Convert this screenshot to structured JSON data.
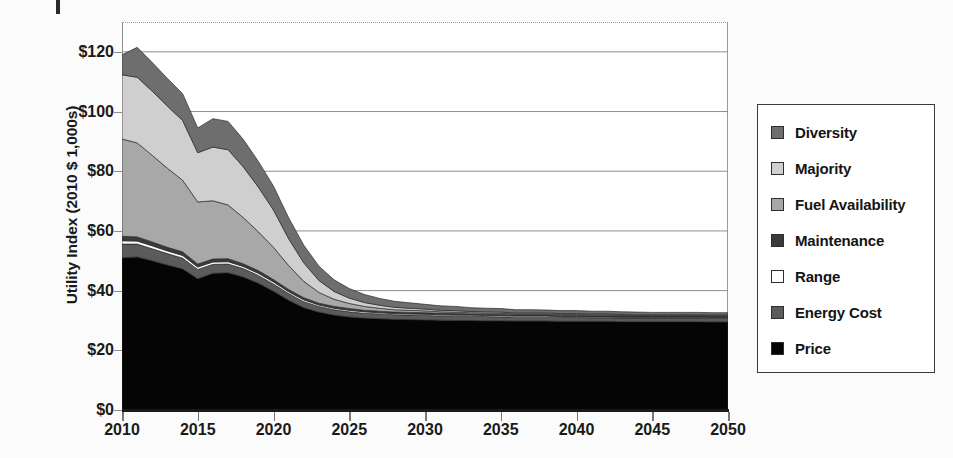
{
  "chart_data": {
    "type": "area",
    "stacked": true,
    "title": "",
    "subtitle": "",
    "xlabel": "",
    "ylabel": "Utility Index (2010 $ 1,000s)",
    "xlim": [
      2010,
      2050
    ],
    "ylim": [
      0,
      130
    ],
    "grid": true,
    "grid_axis": "y",
    "legend_position": "right",
    "x_tick_labels": [
      "2010",
      "2015",
      "2020",
      "2025",
      "2030",
      "2035",
      "2040",
      "2045",
      "2050"
    ],
    "x_ticks": [
      2010,
      2015,
      2020,
      2025,
      2030,
      2035,
      2040,
      2045,
      2050
    ],
    "y_tick_labels": [
      "$0",
      "$20",
      "$40",
      "$60",
      "$80",
      "$100",
      "$120"
    ],
    "y_ticks": [
      0,
      20,
      40,
      60,
      80,
      100,
      120
    ],
    "x": [
      2010,
      2011,
      2012,
      2013,
      2014,
      2015,
      2016,
      2017,
      2018,
      2019,
      2020,
      2021,
      2022,
      2023,
      2024,
      2025,
      2026,
      2027,
      2028,
      2029,
      2030,
      2031,
      2032,
      2033,
      2034,
      2035,
      2036,
      2037,
      2038,
      2039,
      2040,
      2041,
      2042,
      2043,
      2044,
      2045,
      2046,
      2047,
      2048,
      2049,
      2050
    ],
    "stack_order_bottom_to_top": [
      "Price",
      "Energy Cost",
      "Range",
      "Maintenance",
      "Fuel Availability",
      "Majority",
      "Diversity"
    ],
    "series": [
      {
        "name": "Price",
        "color": "#050505",
        "values": [
          51.0,
          51.3,
          50.0,
          48.6,
          47.3,
          44.0,
          45.8,
          46.0,
          44.6,
          42.5,
          39.8,
          36.8,
          34.3,
          32.8,
          31.8,
          31.2,
          30.8,
          30.6,
          30.4,
          30.3,
          30.2,
          30.1,
          30.0,
          30.0,
          29.9,
          29.9,
          29.8,
          29.8,
          29.8,
          29.7,
          29.7,
          29.7,
          29.7,
          29.6,
          29.6,
          29.6,
          29.6,
          29.6,
          29.6,
          29.5,
          29.5
        ]
      },
      {
        "name": "Energy Cost",
        "color": "#5b5b5b",
        "values": [
          4.6,
          4.3,
          4.0,
          3.8,
          3.6,
          3.1,
          3.0,
          2.9,
          2.8,
          2.6,
          2.4,
          2.2,
          2.0,
          1.9,
          1.8,
          1.7,
          1.6,
          1.6,
          1.5,
          1.5,
          1.5,
          1.4,
          1.4,
          1.4,
          1.4,
          1.3,
          1.3,
          1.3,
          1.3,
          1.3,
          1.3,
          1.2,
          1.2,
          1.2,
          1.2,
          1.2,
          1.2,
          1.2,
          1.2,
          1.2,
          1.2
        ]
      },
      {
        "name": "Range",
        "color": "#ffffff",
        "values": [
          1.1,
          1.0,
          1.0,
          0.9,
          0.9,
          0.8,
          0.8,
          0.8,
          0.7,
          0.7,
          0.7,
          0.6,
          0.6,
          0.5,
          0.5,
          0.5,
          0.5,
          0.4,
          0.4,
          0.4,
          0.4,
          0.4,
          0.4,
          0.4,
          0.4,
          0.4,
          0.4,
          0.4,
          0.4,
          0.3,
          0.3,
          0.3,
          0.3,
          0.3,
          0.3,
          0.3,
          0.3,
          0.3,
          0.3,
          0.3,
          0.3
        ]
      },
      {
        "name": "Maintenance",
        "color": "#3a3a3a",
        "values": [
          1.5,
          1.4,
          1.3,
          1.2,
          1.2,
          1.0,
          1.0,
          1.0,
          0.9,
          0.9,
          0.8,
          0.8,
          0.7,
          0.6,
          0.6,
          0.6,
          0.5,
          0.5,
          0.5,
          0.5,
          0.5,
          0.5,
          0.5,
          0.4,
          0.4,
          0.4,
          0.4,
          0.4,
          0.4,
          0.4,
          0.4,
          0.4,
          0.4,
          0.4,
          0.4,
          0.4,
          0.4,
          0.4,
          0.4,
          0.4,
          0.4
        ]
      },
      {
        "name": "Fuel Availability",
        "color": "#a8a8a8",
        "values": [
          32.6,
          31.5,
          29.0,
          26.5,
          24.0,
          20.8,
          19.5,
          18.0,
          15.5,
          13.0,
          10.8,
          8.0,
          5.5,
          3.6,
          2.4,
          1.7,
          1.3,
          1.0,
          0.8,
          0.7,
          0.6,
          0.5,
          0.5,
          0.4,
          0.4,
          0.4,
          0.3,
          0.3,
          0.3,
          0.3,
          0.3,
          0.3,
          0.3,
          0.3,
          0.2,
          0.2,
          0.2,
          0.2,
          0.2,
          0.2,
          0.2
        ]
      },
      {
        "name": "Majority",
        "color": "#cfcfcf",
        "values": [
          21.5,
          22.0,
          21.5,
          20.8,
          20.0,
          16.5,
          18.0,
          18.5,
          17.0,
          15.0,
          12.5,
          9.0,
          6.2,
          4.0,
          2.6,
          1.8,
          1.3,
          1.0,
          0.8,
          0.7,
          0.6,
          0.5,
          0.5,
          0.4,
          0.4,
          0.4,
          0.3,
          0.3,
          0.3,
          0.3,
          0.3,
          0.3,
          0.3,
          0.2,
          0.2,
          0.2,
          0.2,
          0.2,
          0.2,
          0.2,
          0.2
        ]
      },
      {
        "name": "Diversity",
        "color": "#6e6e6e",
        "values": [
          6.7,
          10.0,
          9.6,
          9.3,
          9.0,
          8.3,
          9.5,
          9.5,
          9.2,
          8.6,
          8.0,
          7.0,
          5.9,
          4.8,
          3.9,
          3.2,
          2.7,
          2.3,
          2.0,
          1.8,
          1.6,
          1.5,
          1.4,
          1.3,
          1.2,
          1.2,
          1.1,
          1.1,
          1.0,
          1.0,
          1.0,
          0.9,
          0.9,
          0.9,
          0.9,
          0.8,
          0.8,
          0.8,
          0.8,
          0.8,
          0.8
        ]
      }
    ],
    "totals": [
      119.0,
      121.5,
      116.4,
      111.1,
      106.0,
      94.5,
      97.6,
      96.7,
      90.7,
      83.3,
      75.0,
      64.4,
      55.2,
      48.2,
      43.6,
      40.7,
      38.7,
      37.4,
      36.4,
      35.9,
      35.4,
      34.9,
      34.7,
      34.3,
      34.1,
      34.0,
      33.6,
      33.6,
      33.5,
      33.3,
      33.3,
      33.1,
      33.1,
      32.9,
      32.8,
      32.7,
      32.7,
      32.7,
      32.7,
      32.6,
      32.6
    ]
  },
  "legend": {
    "items": [
      {
        "label": "Diversity",
        "swatch": "#6e6e6e"
      },
      {
        "label": "Majority",
        "swatch": "#cfcfcf"
      },
      {
        "label": "Fuel Availability",
        "swatch": "#a8a8a8"
      },
      {
        "label": "Maintenance",
        "swatch": "#3a3a3a"
      },
      {
        "label": "Range",
        "swatch": "#ffffff"
      },
      {
        "label": "Energy Cost",
        "swatch": "#5b5b5b"
      },
      {
        "label": "Price",
        "swatch": "#050505"
      }
    ]
  },
  "axes": {
    "y_title": "Utility Index (2010 $ 1,000s)"
  },
  "colors": {
    "axis_line": "#1a1a1a",
    "grid_line": "#8d8d8d",
    "text": "#141414",
    "plot_background": "#ffffff",
    "page_background": "#fbfbfb"
  }
}
